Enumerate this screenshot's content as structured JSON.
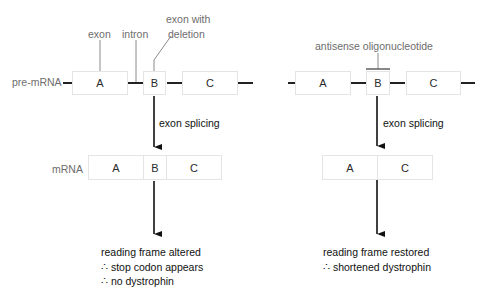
{
  "left_panel": {
    "labels": {
      "exon": "exon",
      "intron": "intron",
      "exon_with_deletion_line1": "exon with",
      "exon_with_deletion_line2": "deletion"
    },
    "pre_mrna_label": "pre-mRNA",
    "pre_mrna_exons": [
      "A",
      "B",
      "C"
    ],
    "step_label": "exon splicing",
    "mrna_label": "mRNA",
    "mrna_exons": [
      "A",
      "B",
      "C"
    ],
    "outcome": [
      "reading frame altered",
      "∴ stop codon appears",
      "∴ no dystrophin"
    ]
  },
  "right_panel": {
    "labels": {
      "antisense": "antisense oligonucleotide"
    },
    "pre_mrna_exons": [
      "A",
      "B",
      "C"
    ],
    "step_label": "exon splicing",
    "mrna_exons": [
      "A",
      "C"
    ],
    "outcome": [
      "reading frame restored",
      "∴ shortened dystrophin"
    ]
  },
  "colors": {
    "line": "#222222",
    "leader": "#8a8a8a",
    "box_border": "#e4e4e4",
    "label_gray": "#6d6d6d",
    "text_dark": "#111111"
  }
}
